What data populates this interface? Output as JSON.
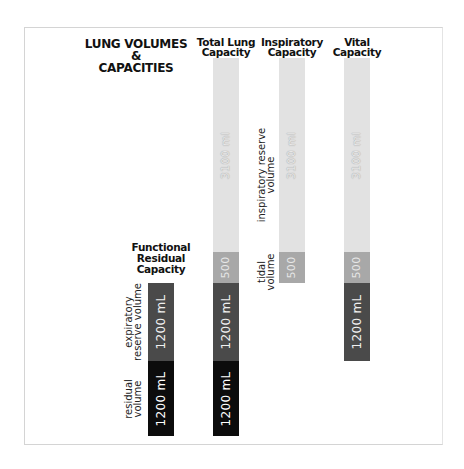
{
  "title": {
    "line1": "LUNG VOLUMES",
    "line2": "&",
    "line3": "CAPACITIES"
  },
  "columns": [
    {
      "id": "tlc",
      "label_line1": "Total Lung",
      "label_line2": "Capacity"
    },
    {
      "id": "ic",
      "label_line1": "Inspiratory",
      "label_line2": "Capacity"
    },
    {
      "id": "vc",
      "label_line1": "Vital",
      "label_line2": "Capacity"
    },
    {
      "id": "frc",
      "label_line1": "Functional",
      "label_line2": "Residual",
      "label_line3": "Capacity"
    }
  ],
  "segments": {
    "irv": "3100 ml",
    "tv": "500",
    "erv": "1200 mL",
    "rv": "1200 mL"
  },
  "labels": {
    "irv": {
      "line1": "inspiratory reserve",
      "line2": "volume"
    },
    "tv": {
      "line1": "tidal",
      "line2": "volume"
    },
    "erv": {
      "line1": "expiratory",
      "line2": "reserve volume"
    },
    "rv": {
      "line1": "residual",
      "line2": "volume"
    }
  },
  "colors": {
    "irv": "#e2e2e2",
    "tv": "#a8a8a8",
    "erv": "#4a4a4a",
    "rv": "#0c0c0c"
  }
}
